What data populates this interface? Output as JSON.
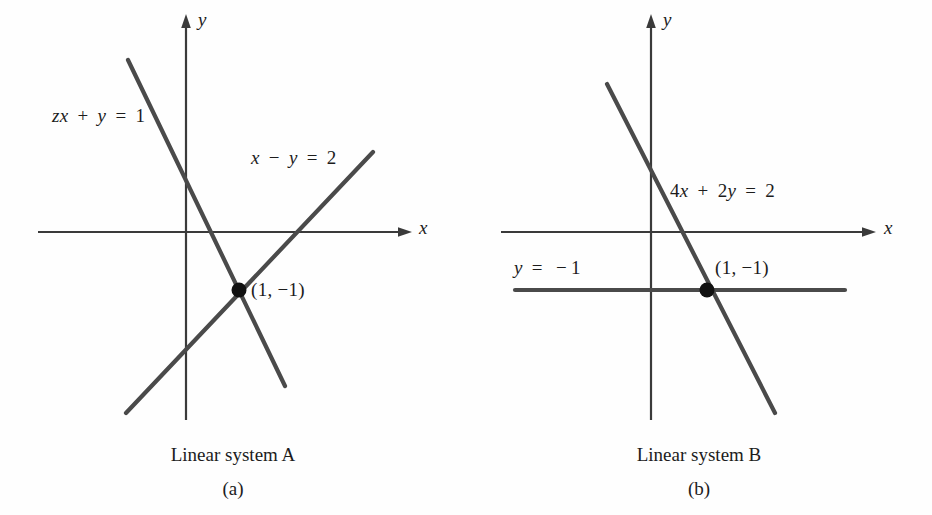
{
  "figure": {
    "background_color": "#fefefe",
    "ink_color": "#3a3a3a",
    "text_color": "#1c1c1c"
  },
  "panels": [
    {
      "id": "a",
      "caption_title": "Linear system A",
      "caption_sub": "(a)",
      "axis_x_label": "x",
      "axis_y_label": "y",
      "point_label": "(1, −1)",
      "equations": [
        {
          "id": "eq-a1",
          "text": "zx + y = 1"
        },
        {
          "id": "eq-a2",
          "text": "x − y = 2"
        }
      ]
    },
    {
      "id": "b",
      "caption_title": "Linear system B",
      "caption_sub": "(b)",
      "axis_x_label": "x",
      "axis_y_label": "y",
      "point_label": "(1, −1)",
      "equations": [
        {
          "id": "eq-b1",
          "text": "4x + 2y = 2"
        },
        {
          "id": "eq-b2",
          "text": "y = −1"
        }
      ]
    }
  ],
  "chart_data": {
    "type": "line",
    "title": "",
    "subtitle": "",
    "grid": false,
    "legend": "none",
    "xlabel": "x",
    "ylabel": "y",
    "panels": [
      {
        "name": "Linear system A",
        "sublabel": "(a)",
        "xlim": [
          -2.2,
          4.0
        ],
        "ylim": [
          -4.2,
          3.6
        ],
        "axes": {
          "x_axis_y": 0,
          "y_axis_x": 0,
          "arrows": [
            "x-positive",
            "y-positive"
          ]
        },
        "series": [
          {
            "name": "zx + y = 1",
            "equation": "2x + y = 1",
            "slope": -2,
            "intercept": 1,
            "x_range": [
              -1.0,
              2.2
            ],
            "label_text": "zx + y = 1"
          },
          {
            "name": "x - y = 2",
            "equation": "x - y = 2",
            "slope": 1,
            "intercept": -2,
            "x_range": [
              -1.05,
              3.3
            ],
            "label_text": "x − y = 2"
          }
        ],
        "annotations": [
          {
            "text": "(1, −1)",
            "x": 1,
            "y": -1,
            "marker": "filled-circle"
          }
        ]
      },
      {
        "name": "Linear system B",
        "sublabel": "(b)",
        "xlim": [
          -2.2,
          4.0
        ],
        "ylim": [
          -4.2,
          3.6
        ],
        "axes": {
          "x_axis_y": 0,
          "y_axis_x": 0,
          "arrows": [
            "x-positive",
            "y-positive"
          ]
        },
        "series": [
          {
            "name": "4x + 2y = 2",
            "equation": "4x + 2y = 2",
            "slope": -2,
            "intercept": 1,
            "x_range": [
              -0.8,
              2.2
            ],
            "label_text": "4x + 2y = 2"
          },
          {
            "name": "y = -1",
            "equation": "y = -1",
            "slope": 0,
            "intercept": -1,
            "x_range": [
              -2.4,
              3.4
            ],
            "label_text": "y = −1"
          }
        ],
        "annotations": [
          {
            "text": "(1, −1)",
            "x": 1,
            "y": -1,
            "marker": "filled-circle"
          }
        ]
      }
    ]
  }
}
